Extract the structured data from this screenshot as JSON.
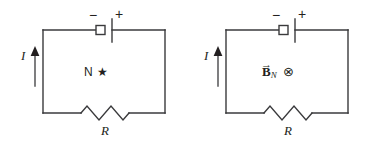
{
  "figure": {
    "stroke_color": "#3a3a3c",
    "text_color": "#231f20",
    "background": "#ffffff"
  },
  "circuits": [
    {
      "id": "left",
      "current_label": "I",
      "battery": {
        "negative_sign": "−",
        "positive_sign": "+"
      },
      "resistor_label": "R",
      "field": {
        "symbol": "N",
        "marker": "★",
        "marker_name": "filled-star"
      }
    },
    {
      "id": "right",
      "current_label": "I",
      "battery": {
        "negative_sign": "−",
        "positive_sign": "+"
      },
      "resistor_label": "R",
      "field": {
        "vector_arrow": "→",
        "symbol": "B",
        "subscript": "N",
        "marker": "⊗",
        "marker_name": "circle-cross-into-page"
      }
    }
  ]
}
